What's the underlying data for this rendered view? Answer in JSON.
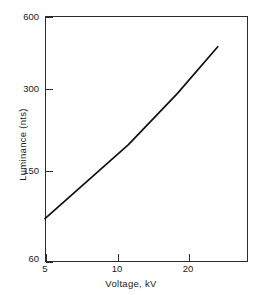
{
  "chart_data": {
    "type": "line",
    "title": "",
    "subtitle": "",
    "xlabel": "Voltage, kV",
    "ylabel": "Luminance (nts)",
    "xscale": "log",
    "yscale": "log",
    "xlim": [
      5,
      27
    ],
    "ylim": [
      60,
      600
    ],
    "grid": false,
    "legend": null,
    "legend_position": "none",
    "xticks": [
      5,
      10,
      20
    ],
    "xticklabels": [
      "5",
      "10",
      "20"
    ],
    "yticks": [
      60,
      150,
      300,
      600
    ],
    "yticklabels": [
      "60",
      "150",
      "300",
      "600"
    ],
    "series": [
      {
        "name": "Luminance vs Voltage",
        "color": "#111111",
        "x": [
          5,
          10,
          15,
          21
        ],
        "y": [
          90,
          180,
          290,
          450
        ]
      }
    ],
    "annotations": []
  },
  "axes": {
    "x_title": "Voltage, kV",
    "y_title": "Luminance (nts)",
    "x_tick_labels": [
      "5",
      "10",
      "20"
    ],
    "y_tick_labels": [
      "60",
      "150",
      "300",
      "600"
    ]
  },
  "colors": {
    "line": "#111111",
    "frame": "#2b2b2b",
    "background": "#ffffff",
    "text": "#1a1a1a"
  }
}
